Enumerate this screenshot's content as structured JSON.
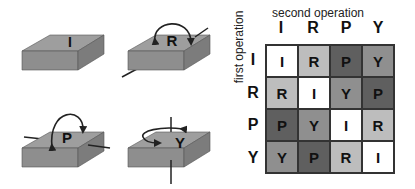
{
  "blocks": [
    {
      "label": "I",
      "operation": "identity"
    },
    {
      "label": "R",
      "operation": "roll"
    },
    {
      "label": "P",
      "operation": "pitch"
    },
    {
      "label": "Y",
      "operation": "yaw"
    }
  ],
  "table": {
    "column_title": "second operation",
    "row_title": "first operation",
    "columns": [
      "I",
      "R",
      "P",
      "Y"
    ],
    "rows": [
      "I",
      "R",
      "P",
      "Y"
    ],
    "cells": [
      [
        "I",
        "R",
        "P",
        "Y"
      ],
      [
        "R",
        "I",
        "Y",
        "P"
      ],
      [
        "P",
        "Y",
        "I",
        "R"
      ],
      [
        "Y",
        "P",
        "R",
        "I"
      ]
    ]
  },
  "colors": {
    "I": "#ffffff",
    "R": "#bdbdbd",
    "Y": "#8f8f8f",
    "P": "#5f5f5f",
    "block_top": "#9a9a9a",
    "block_front": "#8c8c8c",
    "block_side": "#7a7a7a"
  }
}
